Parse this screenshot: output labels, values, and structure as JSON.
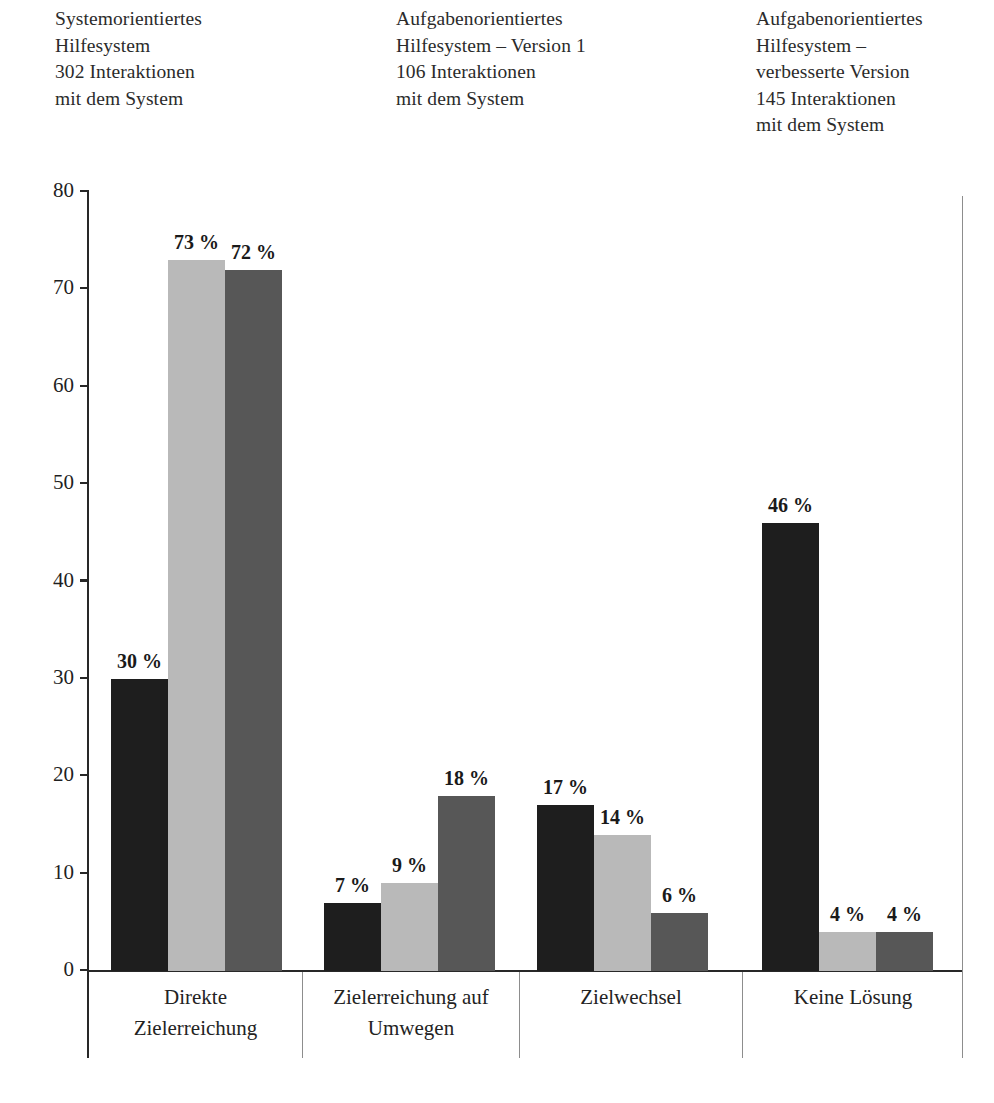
{
  "legend": {
    "blocks": [
      {
        "series_key": "s0",
        "color": "#1e1e1e",
        "lines": [
          "Systemorientiertes",
          "Hilfesystem",
          "302 Interaktionen",
          "mit dem System"
        ]
      },
      {
        "series_key": "s1",
        "color": "#b9b9b9",
        "lines": [
          "Aufgabenorientiertes",
          "Hilfesystem – Version 1",
          "106 Interaktionen",
          "mit dem System"
        ]
      },
      {
        "series_key": "s2",
        "color": "#575757",
        "lines": [
          "Aufgabenorientiertes",
          "Hilfesystem –",
          "verbesserte Version",
          "145 Interaktionen",
          "mit dem System"
        ]
      }
    ]
  },
  "axis": {
    "y_ticks": [
      "80",
      "70",
      "60",
      "50",
      "40",
      "30",
      "20",
      "10",
      "0"
    ],
    "y_min": 0,
    "y_max": 80,
    "y_step": 10
  },
  "categories": [
    {
      "lines": [
        "Direkte",
        "Zielerreichung"
      ]
    },
    {
      "lines": [
        "Zielerreichung auf",
        "Umwegen"
      ]
    },
    {
      "lines": [
        "Zielwechsel"
      ]
    },
    {
      "lines": [
        "Keine Lösung"
      ]
    }
  ],
  "bar_labels": [
    [
      "30 %",
      "73 %",
      "72 %"
    ],
    [
      "7 %",
      "9 %",
      "18 %"
    ],
    [
      "17 %",
      "14 %",
      "6 %"
    ],
    [
      "46 %",
      "4 %",
      "4 %"
    ]
  ],
  "chart_data": {
    "type": "bar",
    "title": "",
    "xlabel": "",
    "ylabel": "",
    "ylim": [
      0,
      80
    ],
    "ytick_step": 10,
    "grid": false,
    "legend_position": "top",
    "value_label_suffix": " %",
    "categories": [
      "Direkte Zielerreichung",
      "Zielerreichung auf Umwegen",
      "Zielwechsel",
      "Keine Lösung"
    ],
    "series": [
      {
        "name": "Systemorientiertes Hilfesystem – 302 Interaktionen mit dem System",
        "color": "#1e1e1e",
        "values": [
          30,
          7,
          17,
          46
        ]
      },
      {
        "name": "Aufgabenorientiertes Hilfesystem – Version 1 – 106 Interaktionen mit dem System",
        "color": "#b9b9b9",
        "values": [
          73,
          9,
          14,
          4
        ]
      },
      {
        "name": "Aufgabenorientiertes Hilfesystem – verbesserte Version – 145 Interaktionen mit dem System",
        "color": "#575757",
        "values": [
          72,
          18,
          6,
          4
        ]
      }
    ]
  },
  "geometry": {
    "plot_left": 88,
    "plot_baseline_y": 970,
    "plot_top_y": 192,
    "px_per_unit": 9.7375,
    "bar_width": 57,
    "group_starts": [
      111,
      324,
      537,
      762
    ],
    "cat_separators": [
      302,
      519,
      742
    ],
    "cat_cell_starts": [
      89,
      303,
      520,
      743
    ],
    "cat_cell_widths": [
      213,
      216,
      222,
      220
    ]
  }
}
